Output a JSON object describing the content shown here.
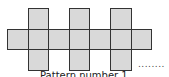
{
  "figure": {
    "fill_color": "#d9d9d9",
    "stroke_color": "#333333",
    "cell_size": 20.6,
    "origin": {
      "x": 7,
      "y": 8
    },
    "cells": [
      {
        "col": 1,
        "row": 0
      },
      {
        "col": 3,
        "row": 0
      },
      {
        "col": 5,
        "row": 0
      },
      {
        "col": 0,
        "row": 1
      },
      {
        "col": 1,
        "row": 1
      },
      {
        "col": 2,
        "row": 1
      },
      {
        "col": 3,
        "row": 1
      },
      {
        "col": 4,
        "row": 1
      },
      {
        "col": 5,
        "row": 1
      },
      {
        "col": 6,
        "row": 1
      },
      {
        "col": 1,
        "row": 2
      },
      {
        "col": 3,
        "row": 2
      },
      {
        "col": 5,
        "row": 2
      }
    ],
    "continuation": "........",
    "caption": "Pattern number 1"
  }
}
